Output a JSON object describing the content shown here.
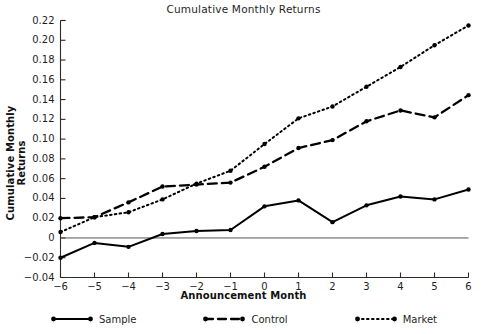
{
  "chart_data": {
    "type": "line",
    "title": "Cumulative Monthly Returns",
    "xlabel": "Announcement Month",
    "ylabel": "Cumulative Monthly Returns",
    "x": [
      -6,
      -5,
      -4,
      -3,
      -2,
      -1,
      0,
      1,
      2,
      3,
      4,
      5,
      6
    ],
    "xtick_labels": [
      "−6",
      "−5",
      "−4",
      "−3",
      "−2",
      "−1",
      "0",
      "1",
      "2",
      "3",
      "4",
      "5",
      "6"
    ],
    "ytick_labels": [
      "0.22",
      "0.20",
      "0.18",
      "0.16",
      "0.14",
      "0.12",
      "0.10",
      "0.08",
      "0.06",
      "0.04",
      "0.02",
      "0",
      "−0.02",
      "−0.04"
    ],
    "yticks": [
      0.22,
      0.2,
      0.18,
      0.16,
      0.14,
      0.12,
      0.1,
      0.08,
      0.06,
      0.04,
      0.02,
      0,
      -0.02,
      -0.04
    ],
    "xlim": [
      -6,
      6
    ],
    "ylim": [
      -0.04,
      0.22
    ],
    "grid": false,
    "zero_line": true,
    "legend_position": "below",
    "series": [
      {
        "name": "Sample",
        "style": "solid",
        "color": "#000000",
        "values": [
          -0.02,
          -0.005,
          -0.009,
          0.004,
          0.007,
          0.008,
          0.032,
          0.038,
          0.016,
          0.033,
          0.042,
          0.039,
          0.049
        ]
      },
      {
        "name": "Control",
        "style": "dashed",
        "color": "#000000",
        "values": [
          0.02,
          0.021,
          0.036,
          0.052,
          0.054,
          0.056,
          0.072,
          0.091,
          0.099,
          0.118,
          0.129,
          0.122,
          0.1445
        ]
      },
      {
        "name": "Market",
        "style": "dotted",
        "color": "#000000",
        "values": [
          0.006,
          0.021,
          0.026,
          0.039,
          0.055,
          0.068,
          0.095,
          0.121,
          0.133,
          0.153,
          0.173,
          0.195,
          0.215
        ]
      }
    ]
  },
  "legend": {
    "items": [
      {
        "label": "Sample",
        "style": "solid"
      },
      {
        "label": "Control",
        "style": "dashed"
      },
      {
        "label": "Market",
        "style": "dotted"
      }
    ]
  }
}
